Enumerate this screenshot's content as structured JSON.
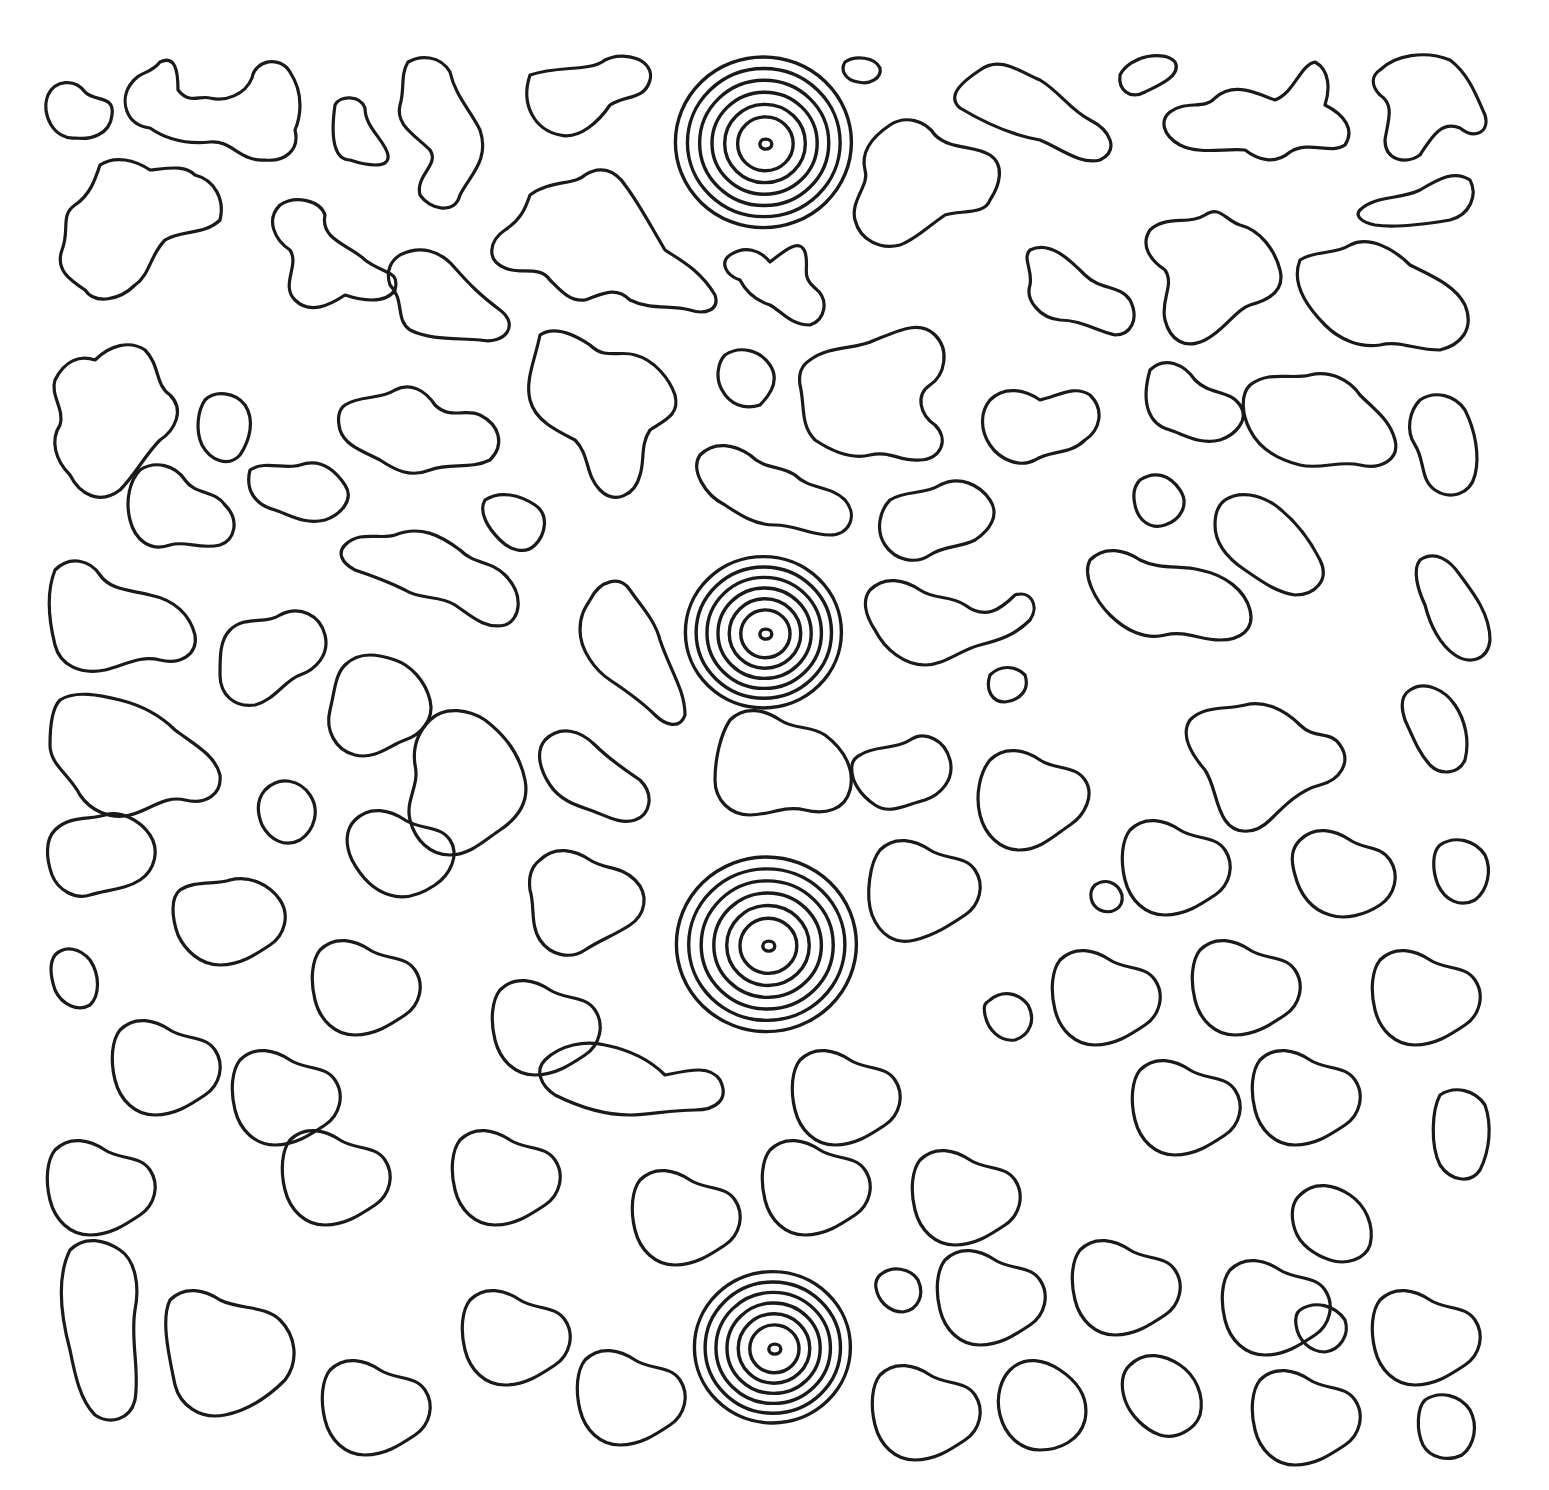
{
  "artwork": {
    "type": "line-art coloring page",
    "background_color": "#ffffff",
    "stroke_color": "#1a1a1a",
    "motif": "organic closed blob outlines",
    "spirals": [
      {
        "cx": 763,
        "cy": 142,
        "r": 88,
        "rings": 7
      },
      {
        "cx": 763,
        "cy": 632,
        "r": 78,
        "rings": 7
      },
      {
        "cx": 766,
        "cy": 944,
        "r": 90,
        "rings": 7
      },
      {
        "cx": 772,
        "cy": 1347,
        "r": 78,
        "rings": 7
      }
    ]
  }
}
